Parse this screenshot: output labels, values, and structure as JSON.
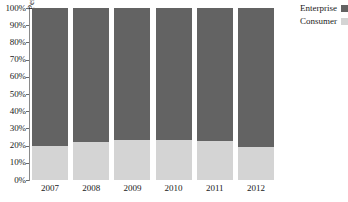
{
  "chart_data": {
    "type": "bar",
    "stacked": true,
    "normalized_to_percent": true,
    "title": "",
    "subtitle": "",
    "xlabel": "",
    "ylabel": "Percent",
    "categories": [
      "2007",
      "2008",
      "2009",
      "2010",
      "2011",
      "2012"
    ],
    "series": [
      {
        "name": "Enterprise",
        "values": [
          80,
          78,
          77,
          77,
          77.5,
          81
        ],
        "color": "#636363"
      },
      {
        "name": "Consumer",
        "values": [
          20,
          22,
          23,
          23,
          22.5,
          19
        ],
        "color": "#d4d4d4"
      }
    ],
    "ylim": [
      0,
      100
    ],
    "ytick_labels": [
      "100%",
      "90%",
      "80%",
      "70%",
      "60%",
      "50%",
      "40%",
      "30%",
      "20%",
      "10%",
      "0%"
    ],
    "ytick_values": [
      100,
      90,
      80,
      70,
      60,
      50,
      40,
      30,
      20,
      10,
      0
    ],
    "grid": false,
    "legend_position": "top-right",
    "legend_entries": [
      {
        "label": "Enterprise",
        "swatch_color": "#636363"
      },
      {
        "label": "Consumer",
        "swatch_color": "#d4d4d4"
      }
    ]
  },
  "axis": {
    "y_title": "Percent",
    "y_ticks": [
      {
        "label": "100%",
        "value": 100
      },
      {
        "label": "90%",
        "value": 90
      },
      {
        "label": "80%",
        "value": 80
      },
      {
        "label": "70%",
        "value": 70
      },
      {
        "label": "60%",
        "value": 60
      },
      {
        "label": "50%",
        "value": 50
      },
      {
        "label": "40%",
        "value": 40
      },
      {
        "label": "30%",
        "value": 30
      },
      {
        "label": "20%",
        "value": 20
      },
      {
        "label": "10%",
        "value": 10
      },
      {
        "label": "0%",
        "value": 0
      }
    ],
    "x_ticks": [
      "2007",
      "2008",
      "2009",
      "2010",
      "2011",
      "2012"
    ]
  },
  "legend": {
    "items": [
      {
        "label": "Enterprise",
        "color": "#636363"
      },
      {
        "label": "Consumer",
        "color": "#d4d4d4"
      }
    ]
  },
  "colors": {
    "enterprise": "#636363",
    "consumer": "#d4d4d4",
    "axis_line": "#8a8a8a",
    "text": "#1a1a1a",
    "background": "#ffffff"
  }
}
